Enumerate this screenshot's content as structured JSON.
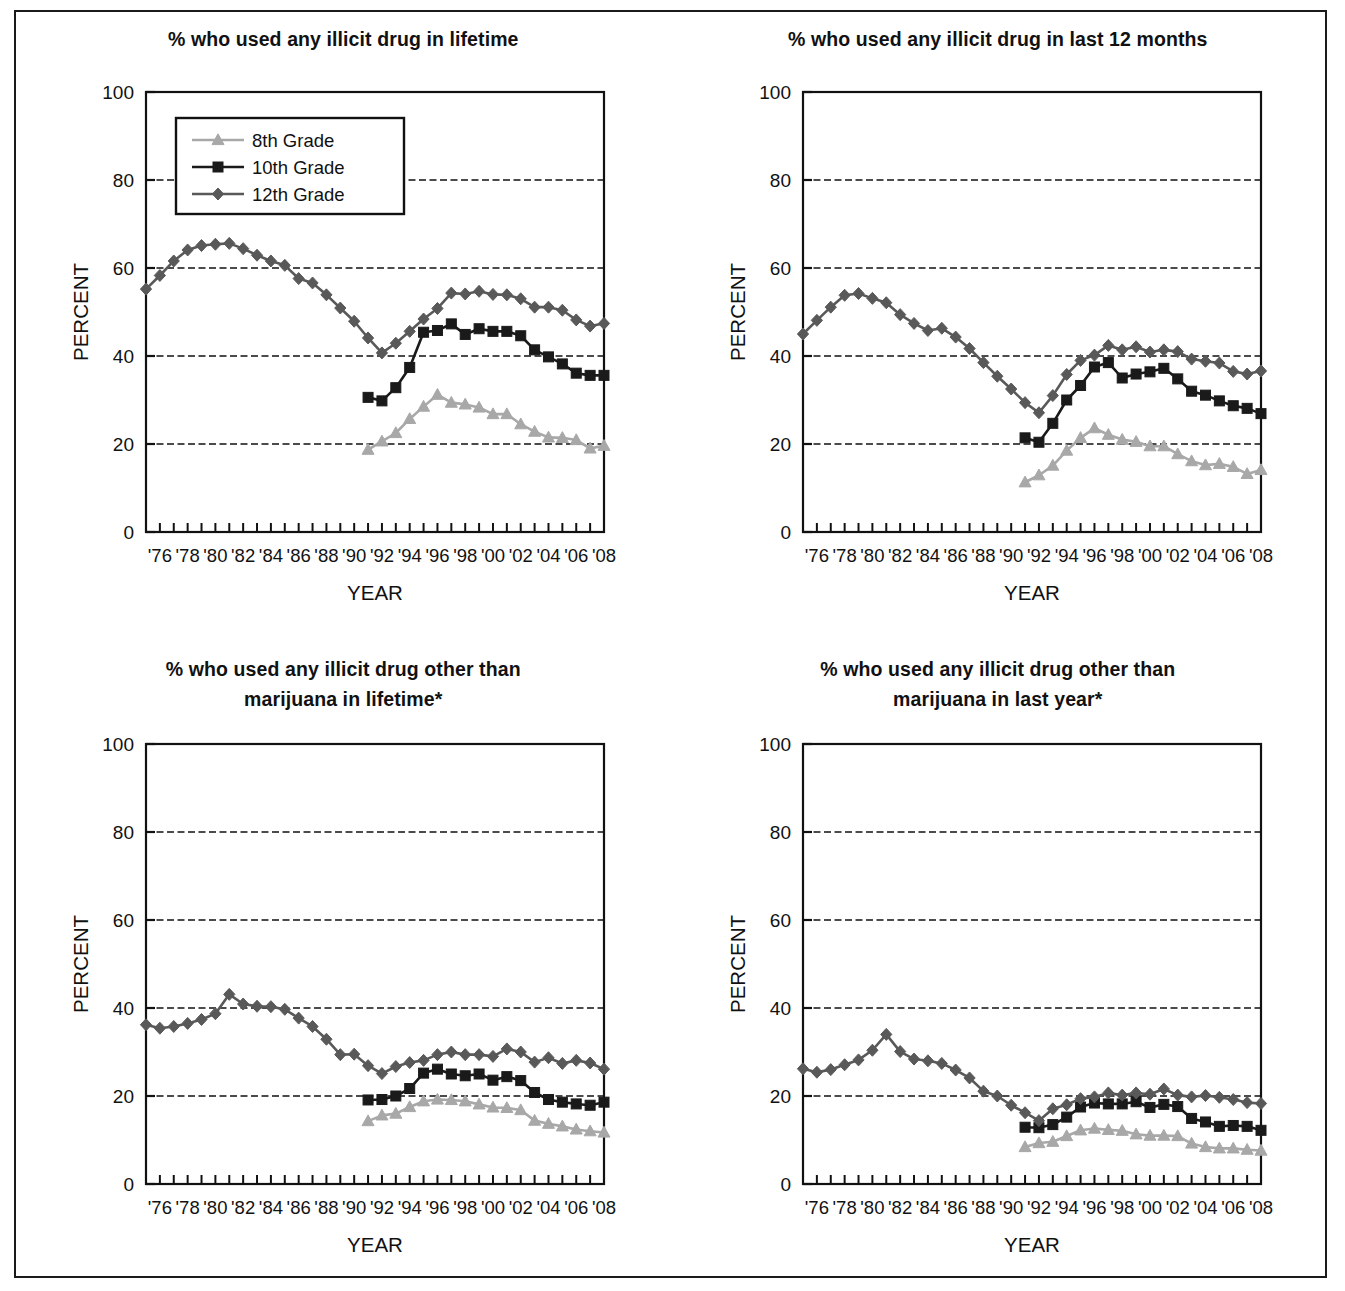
{
  "figure": {
    "panel_count": 4,
    "legend": {
      "items": [
        {
          "label": "8th Grade",
          "marker": "triangle",
          "color": "#a8a8a8"
        },
        {
          "label": "10th Grade",
          "marker": "square",
          "color": "#1a1a1a"
        },
        {
          "label": "12th Grade",
          "marker": "diamond",
          "color": "#595959"
        }
      ]
    }
  },
  "axes": {
    "ylabel": "PERCENT",
    "xlabel": "YEAR",
    "yticks": [
      "0",
      "20",
      "40",
      "60",
      "80",
      "100"
    ],
    "xticklabels": [
      "'76",
      "'78",
      "'80",
      "'82",
      "'84",
      "'86",
      "'88",
      "'90",
      "'92",
      "'94",
      "'96",
      "'98",
      "'00",
      "'02",
      "'04",
      "'06",
      "'08"
    ]
  },
  "chart_data": [
    {
      "type": "line",
      "panel": "top-left",
      "title": "% who used any illicit drug in lifetime",
      "xlabel": "YEAR",
      "ylabel": "PERCENT",
      "ylim": [
        0,
        100
      ],
      "xlim": [
        1975,
        2008
      ],
      "grid": true,
      "legend_position": "upper-left-inside",
      "x": [
        1975,
        1976,
        1977,
        1978,
        1979,
        1980,
        1981,
        1982,
        1983,
        1984,
        1985,
        1986,
        1987,
        1988,
        1989,
        1990,
        1991,
        1992,
        1993,
        1994,
        1995,
        1996,
        1997,
        1998,
        1999,
        2000,
        2001,
        2002,
        2003,
        2004,
        2005,
        2006,
        2007,
        2008
      ],
      "series": [
        {
          "name": "8th Grade",
          "color": "#a8a8a8",
          "marker": "triangle",
          "x": [
            1991,
            1992,
            1993,
            1994,
            1995,
            1996,
            1997,
            1998,
            1999,
            2000,
            2001,
            2002,
            2003,
            2004,
            2005,
            2006,
            2007,
            2008
          ],
          "values": [
            18.7,
            20.6,
            22.5,
            25.7,
            28.5,
            31.2,
            29.4,
            29.0,
            28.3,
            26.8,
            26.8,
            24.5,
            22.8,
            21.5,
            21.4,
            20.9,
            19.0,
            19.6
          ]
        },
        {
          "name": "10th Grade",
          "color": "#1a1a1a",
          "marker": "square",
          "x": [
            1991,
            1992,
            1993,
            1994,
            1995,
            1996,
            1997,
            1998,
            1999,
            2000,
            2001,
            2002,
            2003,
            2004,
            2005,
            2006,
            2007,
            2008
          ],
          "values": [
            30.6,
            29.8,
            32.8,
            37.4,
            45.4,
            45.8,
            47.3,
            44.9,
            46.2,
            45.6,
            45.6,
            44.6,
            41.4,
            39.8,
            38.2,
            36.1,
            35.6,
            35.6
          ]
        },
        {
          "name": "12th Grade",
          "color": "#595959",
          "marker": "diamond",
          "x": [
            1975,
            1976,
            1977,
            1978,
            1979,
            1980,
            1981,
            1982,
            1983,
            1984,
            1985,
            1986,
            1987,
            1988,
            1989,
            1990,
            1991,
            1992,
            1993,
            1994,
            1995,
            1996,
            1997,
            1998,
            1999,
            2000,
            2001,
            2002,
            2003,
            2004,
            2005,
            2006,
            2007,
            2008
          ],
          "values": [
            55.2,
            58.3,
            61.6,
            64.1,
            65.1,
            65.4,
            65.6,
            64.4,
            62.9,
            61.6,
            60.6,
            57.6,
            56.6,
            53.9,
            50.9,
            47.9,
            44.1,
            40.7,
            42.9,
            45.6,
            48.4,
            50.8,
            54.3,
            54.1,
            54.7,
            54.0,
            53.9,
            53.0,
            51.1,
            51.1,
            50.4,
            48.2,
            46.8,
            47.4
          ]
        }
      ]
    },
    {
      "type": "line",
      "panel": "top-right",
      "title": "% who used any illicit drug in last 12 months",
      "xlabel": "YEAR",
      "ylabel": "PERCENT",
      "ylim": [
        0,
        100
      ],
      "xlim": [
        1975,
        2008
      ],
      "grid": true,
      "legend_position": "none",
      "x": [
        1975,
        1976,
        1977,
        1978,
        1979,
        1980,
        1981,
        1982,
        1983,
        1984,
        1985,
        1986,
        1987,
        1988,
        1989,
        1990,
        1991,
        1992,
        1993,
        1994,
        1995,
        1996,
        1997,
        1998,
        1999,
        2000,
        2001,
        2002,
        2003,
        2004,
        2005,
        2006,
        2007,
        2008
      ],
      "series": [
        {
          "name": "8th Grade",
          "color": "#a8a8a8",
          "marker": "triangle",
          "x": [
            1991,
            1992,
            1993,
            1994,
            1995,
            1996,
            1997,
            1998,
            1999,
            2000,
            2001,
            2002,
            2003,
            2004,
            2005,
            2006,
            2007,
            2008
          ],
          "values": [
            11.3,
            12.9,
            15.1,
            18.5,
            21.4,
            23.6,
            22.1,
            21.0,
            20.5,
            19.5,
            19.5,
            17.7,
            16.1,
            15.2,
            15.5,
            14.8,
            13.2,
            14.1
          ]
        },
        {
          "name": "10th Grade",
          "color": "#1a1a1a",
          "marker": "square",
          "x": [
            1991,
            1992,
            1993,
            1994,
            1995,
            1996,
            1997,
            1998,
            1999,
            2000,
            2001,
            2002,
            2003,
            2004,
            2005,
            2006,
            2007,
            2008
          ],
          "values": [
            21.4,
            20.4,
            24.7,
            30.0,
            33.3,
            37.5,
            38.5,
            35.0,
            35.9,
            36.4,
            37.2,
            34.8,
            32.0,
            31.1,
            29.8,
            28.7,
            28.1,
            26.9
          ]
        },
        {
          "name": "12th Grade",
          "color": "#595959",
          "marker": "diamond",
          "x": [
            1975,
            1976,
            1977,
            1978,
            1979,
            1980,
            1981,
            1982,
            1983,
            1984,
            1985,
            1986,
            1987,
            1988,
            1989,
            1990,
            1991,
            1992,
            1993,
            1994,
            1995,
            1996,
            1997,
            1998,
            1999,
            2000,
            2001,
            2002,
            2003,
            2004,
            2005,
            2006,
            2007,
            2008
          ],
          "values": [
            45.0,
            48.1,
            51.1,
            53.8,
            54.2,
            53.1,
            52.1,
            49.4,
            47.4,
            45.8,
            46.3,
            44.3,
            41.7,
            38.5,
            35.4,
            32.5,
            29.4,
            27.1,
            31.0,
            35.8,
            39.0,
            40.2,
            42.4,
            41.4,
            42.1,
            40.9,
            41.4,
            41.0,
            39.3,
            38.8,
            38.4,
            36.5,
            35.9,
            36.6
          ]
        }
      ]
    },
    {
      "type": "line",
      "panel": "bottom-left",
      "title_line1": "% who used any illicit drug other than",
      "title_line2": "marijuana in lifetime*",
      "title": "% who used any illicit drug other than marijuana in lifetime*",
      "xlabel": "YEAR",
      "ylabel": "PERCENT",
      "ylim": [
        0,
        100
      ],
      "xlim": [
        1975,
        2008
      ],
      "grid": true,
      "legend_position": "none",
      "x": [
        1975,
        1976,
        1977,
        1978,
        1979,
        1980,
        1981,
        1982,
        1983,
        1984,
        1985,
        1986,
        1987,
        1988,
        1989,
        1990,
        1991,
        1992,
        1993,
        1994,
        1995,
        1996,
        1997,
        1998,
        1999,
        2000,
        2001,
        2002,
        2003,
        2004,
        2005,
        2006,
        2007,
        2008
      ],
      "series": [
        {
          "name": "8th Grade",
          "color": "#a8a8a8",
          "marker": "triangle",
          "x": [
            1991,
            1992,
            1993,
            1994,
            1995,
            1996,
            1997,
            1998,
            1999,
            2000,
            2001,
            2002,
            2003,
            2004,
            2005,
            2006,
            2007,
            2008
          ],
          "values": [
            14.3,
            15.6,
            16.0,
            17.5,
            18.8,
            19.2,
            19.1,
            18.8,
            18.1,
            17.4,
            17.3,
            16.8,
            14.4,
            13.7,
            13.1,
            12.4,
            12.0,
            11.7
          ]
        },
        {
          "name": "10th Grade",
          "color": "#1a1a1a",
          "marker": "square",
          "x": [
            1991,
            1992,
            1993,
            1994,
            1995,
            1996,
            1997,
            1998,
            1999,
            2000,
            2001,
            2002,
            2003,
            2004,
            2005,
            2006,
            2007,
            2008
          ],
          "values": [
            19.1,
            19.2,
            20.0,
            21.7,
            25.2,
            26.1,
            25.0,
            24.6,
            25.0,
            23.6,
            24.4,
            23.5,
            20.8,
            19.2,
            18.6,
            18.2,
            17.9,
            18.6
          ]
        },
        {
          "name": "12th Grade",
          "color": "#595959",
          "marker": "diamond",
          "x": [
            1975,
            1976,
            1977,
            1978,
            1979,
            1980,
            1981,
            1982,
            1983,
            1984,
            1985,
            1986,
            1987,
            1988,
            1989,
            1990,
            1991,
            1992,
            1993,
            1994,
            1995,
            1996,
            1997,
            1998,
            1999,
            2000,
            2001,
            2002,
            2003,
            2004,
            2005,
            2006,
            2007,
            2008
          ],
          "values": [
            36.2,
            35.4,
            35.8,
            36.5,
            37.4,
            38.7,
            43.1,
            40.9,
            40.4,
            40.3,
            39.7,
            37.7,
            35.8,
            32.9,
            29.4,
            29.5,
            26.9,
            25.1,
            26.7,
            27.6,
            28.1,
            29.4,
            30.0,
            29.4,
            29.4,
            29.0,
            30.7,
            30.0,
            27.7,
            28.7,
            27.4,
            28.1,
            27.5,
            26.1
          ]
        }
      ]
    },
    {
      "type": "line",
      "panel": "bottom-right",
      "title_line1": "% who used any illicit drug other than",
      "title_line2": "marijuana in last year*",
      "title": "% who used any illicit drug other than marijuana in last year*",
      "xlabel": "YEAR",
      "ylabel": "PERCENT",
      "ylim": [
        0,
        100
      ],
      "xlim": [
        1975,
        2008
      ],
      "grid": true,
      "legend_position": "none",
      "x": [
        1975,
        1976,
        1977,
        1978,
        1979,
        1980,
        1981,
        1982,
        1983,
        1984,
        1985,
        1986,
        1987,
        1988,
        1989,
        1990,
        1991,
        1992,
        1993,
        1994,
        1995,
        1996,
        1997,
        1998,
        1999,
        2000,
        2001,
        2002,
        2003,
        2004,
        2005,
        2006,
        2007,
        2008
      ],
      "series": [
        {
          "name": "8th Grade",
          "color": "#a8a8a8",
          "marker": "triangle",
          "x": [
            1991,
            1992,
            1993,
            1994,
            1995,
            1996,
            1997,
            1998,
            1999,
            2000,
            2001,
            2002,
            2003,
            2004,
            2005,
            2006,
            2007,
            2008
          ],
          "values": [
            8.4,
            9.3,
            9.6,
            10.9,
            12.2,
            12.6,
            12.3,
            12.1,
            11.3,
            11.0,
            11.0,
            10.9,
            9.2,
            8.4,
            8.1,
            8.1,
            7.8,
            7.6
          ]
        },
        {
          "name": "10th Grade",
          "color": "#1a1a1a",
          "marker": "square",
          "x": [
            1991,
            1992,
            1993,
            1994,
            1995,
            1996,
            1997,
            1998,
            1999,
            2000,
            2001,
            2002,
            2003,
            2004,
            2005,
            2006,
            2007,
            2008
          ],
          "values": [
            12.9,
            12.8,
            13.5,
            15.2,
            17.5,
            18.4,
            18.2,
            18.2,
            18.7,
            17.4,
            18.1,
            17.6,
            14.9,
            14.1,
            13.1,
            13.3,
            13.1,
            12.2
          ]
        },
        {
          "name": "12th Grade",
          "color": "#595959",
          "marker": "diamond",
          "x": [
            1975,
            1976,
            1977,
            1978,
            1979,
            1980,
            1981,
            1982,
            1983,
            1984,
            1985,
            1986,
            1987,
            1988,
            1989,
            1990,
            1991,
            1992,
            1993,
            1994,
            1995,
            1996,
            1997,
            1998,
            1999,
            2000,
            2001,
            2002,
            2003,
            2004,
            2005,
            2006,
            2007,
            2008
          ],
          "values": [
            26.2,
            25.4,
            26.0,
            27.1,
            28.2,
            30.4,
            34.0,
            30.1,
            28.4,
            28.0,
            27.4,
            25.9,
            24.1,
            21.1,
            20.0,
            17.9,
            16.2,
            14.4,
            17.1,
            18.0,
            19.4,
            19.8,
            20.7,
            20.2,
            20.7,
            20.4,
            21.6,
            20.2,
            19.8,
            20.1,
            19.7,
            19.2,
            18.5,
            18.3
          ]
        }
      ]
    }
  ]
}
